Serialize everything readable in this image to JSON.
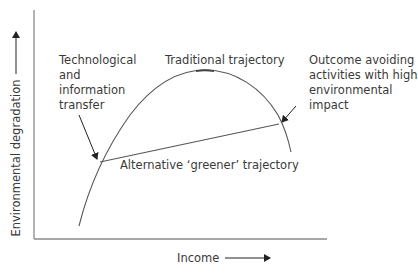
{
  "diagram": {
    "type": "environmental-kuznets-curve",
    "axes": {
      "y_label": "Environmental degradation",
      "x_label": "Income"
    },
    "annotations": {
      "tech_transfer": [
        "Technological",
        "and",
        "information",
        "transfer"
      ],
      "traditional": "Traditional trajectory",
      "outcome": [
        "Outcome avoiding",
        "activities with high",
        "environmental",
        "impact"
      ],
      "alternative": "Alternative ‘greener’ trajectory"
    },
    "colors": {
      "axis": "#7a7a7a",
      "curve": "#555555",
      "text": "#3a3a3a",
      "arrow": "#222222"
    }
  }
}
